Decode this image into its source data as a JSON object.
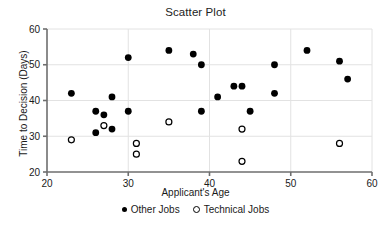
{
  "chart_data": {
    "type": "scatter",
    "title": "Scatter Plot",
    "xlabel": "Applicant's Age",
    "ylabel": "Time to Decision (Days)",
    "xlim": [
      20,
      60
    ],
    "ylim": [
      20,
      60
    ],
    "xticks": [
      20,
      30,
      40,
      50,
      60
    ],
    "yticks": [
      20,
      30,
      40,
      50,
      60
    ],
    "grid": true,
    "legend_position": "below-axis-center",
    "series": [
      {
        "name": "Other Jobs",
        "marker": "filled-circle",
        "color": "#000000",
        "points": [
          [
            23,
            42
          ],
          [
            26,
            37
          ],
          [
            26,
            31
          ],
          [
            27,
            36
          ],
          [
            28,
            32
          ],
          [
            28,
            41
          ],
          [
            30,
            52
          ],
          [
            30,
            37
          ],
          [
            35,
            54
          ],
          [
            38,
            53
          ],
          [
            39,
            50
          ],
          [
            39,
            37
          ],
          [
            41,
            41
          ],
          [
            43,
            44
          ],
          [
            44,
            44
          ],
          [
            45,
            37
          ],
          [
            48,
            50
          ],
          [
            48,
            42
          ],
          [
            52,
            54
          ],
          [
            56,
            51
          ],
          [
            57,
            46
          ]
        ]
      },
      {
        "name": "Technical Jobs",
        "marker": "open-circle",
        "color": "#000000",
        "points": [
          [
            23,
            29
          ],
          [
            27,
            33
          ],
          [
            31,
            28
          ],
          [
            31,
            25
          ],
          [
            35,
            34
          ],
          [
            44,
            32
          ],
          [
            44,
            23
          ],
          [
            56,
            28
          ]
        ]
      }
    ]
  },
  "legend": {
    "entries": [
      {
        "label": "Other Jobs"
      },
      {
        "label": "Technical Jobs"
      }
    ]
  },
  "axis_tick_labels": {
    "x": [
      "20",
      "30",
      "40",
      "50",
      "60"
    ],
    "y": [
      "20",
      "30",
      "40",
      "50",
      "60"
    ]
  }
}
